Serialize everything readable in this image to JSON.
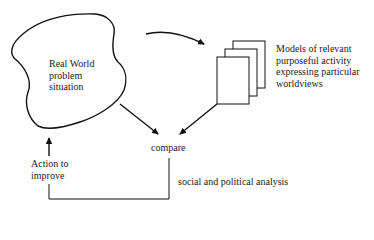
{
  "diagram": {
    "type": "soft-systems-methodology-cycle",
    "nodes": {
      "real_world": {
        "label": "Real World\nproblem\nsituation",
        "shape": "cloud-blob"
      },
      "models": {
        "label": "Models of relevant\npurposeful activity\nexpressing particular\nworldviews",
        "shape": "stacked-pages"
      },
      "compare": {
        "label": "compare"
      },
      "action": {
        "label": "Action to\nimprove"
      },
      "analysis": {
        "label": "social and political analysis"
      }
    },
    "edges": [
      {
        "from": "real_world",
        "to": "models",
        "style": "curved-arrow"
      },
      {
        "from": "real_world",
        "to": "compare",
        "style": "arrow"
      },
      {
        "from": "models",
        "to": "compare",
        "style": "arrow"
      },
      {
        "from": "compare",
        "to": "action",
        "style": "bracket-line"
      },
      {
        "from": "action",
        "to": "real_world",
        "style": "arrow"
      }
    ],
    "colors": {
      "stroke": "#111111",
      "text": "#222222",
      "background": "#ffffff"
    }
  }
}
